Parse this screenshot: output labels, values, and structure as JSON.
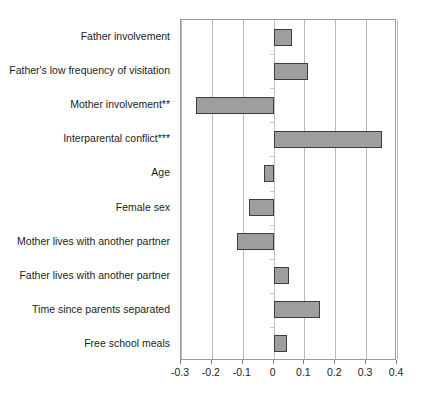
{
  "chart_data": {
    "type": "bar",
    "orientation": "horizontal",
    "title": "",
    "subtitle": "",
    "xlabel": "",
    "ylabel": "",
    "xlim": [
      -0.3,
      0.4
    ],
    "ylim": null,
    "grid": true,
    "legend": null,
    "legend_position": "none",
    "bar_color": "#9e9e9e",
    "bar_border_color": "#3d3d3d",
    "xticks": [
      "-0.3",
      "-0.2",
      "-0.1",
      "0",
      "0.1",
      "0.2",
      "0.3",
      "0.4"
    ],
    "xtick_values": [
      -0.3,
      -0.2,
      -0.1,
      0,
      0.1,
      0.2,
      0.3,
      0.4
    ],
    "categories": [
      "Father involvement",
      "Father's low frequency of visitation",
      "Mother involvement**",
      "Interparental conflict***",
      "Age",
      "Female sex",
      "Mother lives with another partner",
      "Father lives with another partner",
      "Time since parents separated",
      "Free school meals"
    ],
    "values": [
      0.06,
      0.11,
      -0.25,
      0.35,
      -0.03,
      -0.08,
      -0.12,
      0.05,
      0.15,
      0.045
    ],
    "annotations": [
      "** denotes significance on Mother involvement",
      "*** denotes significance on Interparental conflict"
    ]
  }
}
